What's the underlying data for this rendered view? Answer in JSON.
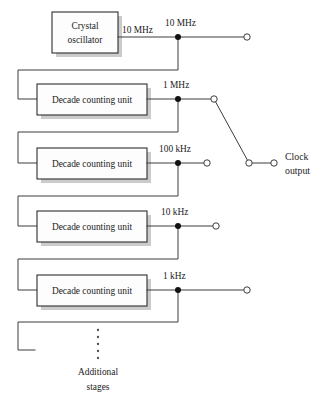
{
  "diagram": {
    "colors": {
      "wire": "#3c3c3c",
      "box_fill": "#fdfdfd",
      "box_stroke": "#2e2e2e",
      "shadow": "#b9b9b9",
      "node": "#111111",
      "text": "#1b1b1b"
    },
    "source": {
      "label_line1": "Crystal",
      "label_line2": "oscillator",
      "output_freq": "10 MHz"
    },
    "stages": [
      {
        "id": "stage-10mhz",
        "box_label": "",
        "freq": "10 MHz",
        "terminal": "long"
      },
      {
        "id": "stage-1mhz",
        "box_label": "Decade counting unit",
        "freq": "1 MHz",
        "terminal": "switch"
      },
      {
        "id": "stage-100khz",
        "box_label": "Decade counting unit",
        "freq": "100 kHz",
        "terminal": "short"
      },
      {
        "id": "stage-10khz",
        "box_label": "Decade counting unit",
        "freq": "10 kHz",
        "terminal": "short"
      },
      {
        "id": "stage-1khz",
        "box_label": "Decade counting unit",
        "freq": "1 kHz",
        "terminal": "long"
      }
    ],
    "output": {
      "label_line1": "Clock",
      "label_line2": "output"
    },
    "additional": {
      "label_line1": "Additional",
      "label_line2": "stages",
      "ellipsis": "vertical-dots"
    }
  }
}
